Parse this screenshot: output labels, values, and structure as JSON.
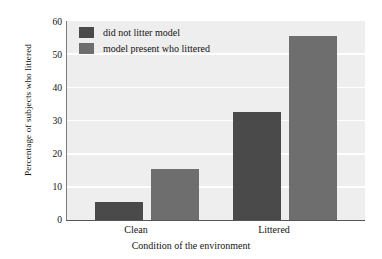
{
  "chart_data": {
    "type": "bar",
    "title": "",
    "subtitle": "",
    "xlabel": "Condition of the environment",
    "ylabel": "Percentage of subjects who littered",
    "categories": [
      "Clean",
      "Littered"
    ],
    "series": [
      {
        "name": "did not litter model",
        "color": "#4a4a4a",
        "values": [
          5.5,
          32.5
        ]
      },
      {
        "name": "model present who littered",
        "color": "#6e6e6e",
        "values": [
          15.5,
          55.5
        ]
      }
    ],
    "ylim": [
      0,
      60
    ],
    "yticks": [
      0,
      10,
      20,
      30,
      40,
      50,
      60
    ],
    "ytick_labels": [
      "0",
      "10",
      "20",
      "30",
      "40",
      "50",
      "60"
    ],
    "grid": "horizontal-white-gridlines",
    "legend_position": "top-left-inside",
    "plot_background": "#eeeeee",
    "gridline_color": "#ffffff",
    "axis_color": "#555555"
  },
  "legend": {
    "entries": [
      {
        "label": "did not litter model",
        "color": "#4a4a4a"
      },
      {
        "label": "model present who littered",
        "color": "#6e6e6e"
      }
    ]
  },
  "axes": {
    "y_title": "Percentage of subjects who littered",
    "x_title": "Condition of the environment",
    "y_ticks": [
      "60",
      "50",
      "40",
      "30",
      "20",
      "10",
      "0"
    ],
    "x_ticks": [
      "Clean",
      "Littered"
    ]
  }
}
